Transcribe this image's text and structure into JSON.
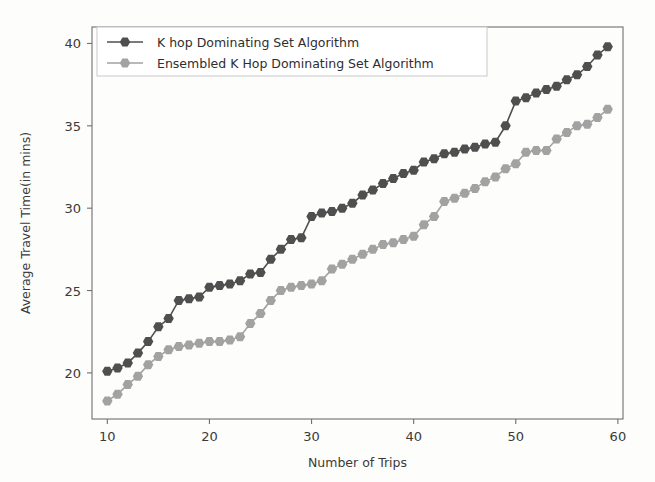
{
  "chart_data": {
    "type": "line",
    "title": "",
    "xlabel": "Number of Trips",
    "ylabel": "Average Travel Time(in mins)",
    "xlim": [
      8.5,
      60.5
    ],
    "ylim": [
      17.2,
      41.0
    ],
    "xticks": [
      10,
      20,
      30,
      40,
      50,
      60
    ],
    "yticks": [
      20,
      25,
      30,
      35,
      40
    ],
    "xticklabels": [
      "10",
      "20",
      "30",
      "40",
      "50",
      "60"
    ],
    "yticklabels": [
      "20",
      "25",
      "30",
      "35",
      "40"
    ],
    "grid": false,
    "legend_position": "upper left",
    "marker": "hexagon",
    "x": [
      10,
      11,
      12,
      13,
      14,
      15,
      16,
      17,
      18,
      19,
      20,
      21,
      22,
      23,
      24,
      25,
      26,
      27,
      28,
      29,
      30,
      31,
      32,
      33,
      34,
      35,
      36,
      37,
      38,
      39,
      40,
      41,
      42,
      43,
      44,
      45,
      46,
      47,
      48,
      49,
      50,
      51,
      52,
      53,
      54,
      55,
      56,
      57,
      58,
      59
    ],
    "series": [
      {
        "name": "K hop Dominating Set Algorithm",
        "color": "#4f4f4f",
        "values": [
          20.1,
          20.3,
          20.6,
          21.2,
          21.9,
          22.8,
          23.3,
          24.4,
          24.5,
          24.6,
          25.2,
          25.3,
          25.4,
          25.6,
          26.0,
          26.1,
          26.9,
          27.5,
          28.1,
          28.2,
          29.5,
          29.7,
          29.8,
          30.0,
          30.3,
          30.8,
          31.1,
          31.5,
          31.8,
          32.1,
          32.3,
          32.8,
          33.0,
          33.3,
          33.4,
          33.6,
          33.7,
          33.9,
          34.0,
          35.0,
          36.5,
          36.7,
          37.0,
          37.2,
          37.4,
          37.8,
          38.1,
          38.6,
          39.3,
          39.8
        ]
      },
      {
        "name": "Ensembled K Hop Dominating Set Algorithm",
        "color": "#a2a2a2",
        "values": [
          18.3,
          18.7,
          19.3,
          19.8,
          20.5,
          21.0,
          21.4,
          21.6,
          21.7,
          21.8,
          21.9,
          21.9,
          22.0,
          22.2,
          23.0,
          23.6,
          24.4,
          25.0,
          25.2,
          25.3,
          25.4,
          25.6,
          26.3,
          26.6,
          26.9,
          27.2,
          27.5,
          27.8,
          27.9,
          28.1,
          28.3,
          29.0,
          29.5,
          30.4,
          30.6,
          30.9,
          31.2,
          31.6,
          31.9,
          32.4,
          32.7,
          33.4,
          33.5,
          33.5,
          34.2,
          34.6,
          35.0,
          35.1,
          35.5,
          36.0
        ]
      }
    ]
  }
}
